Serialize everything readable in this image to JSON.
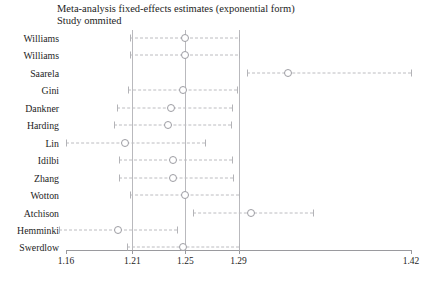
{
  "chart_data": {
    "type": "scatter",
    "title": "Meta-analysis fixed-effects estimates (exponential form)",
    "subtitle": "Study ommited",
    "xlabel": "",
    "ylabel": "",
    "xlim": [
      1.16,
      1.42
    ],
    "grid": false,
    "legend": null,
    "xticks": [
      1.16,
      1.21,
      1.25,
      1.29,
      1.42
    ],
    "xtick_labels": [
      "1.16",
      "1.21",
      "1.25",
      "1.29",
      "1.42"
    ],
    "reference_lines": [
      1.21,
      1.25,
      1.29
    ],
    "categories": [
      "Williams",
      "Williams",
      "Saarela",
      "Gini",
      "Dankner",
      "Harding",
      "Lin",
      "Idilbi",
      "Zhang",
      "Wotton",
      "Atchison",
      "Hemminki",
      "Swerdlow"
    ],
    "values": [
      1.25,
      1.25,
      1.327,
      1.248,
      1.239,
      1.237,
      1.2045,
      1.2405,
      1.2405,
      1.2495,
      1.2995,
      1.1995,
      1.248
    ],
    "lower": [
      1.2085,
      1.2085,
      1.2965,
      1.207,
      1.1985,
      1.196,
      1.1598,
      1.2,
      1.2,
      1.2085,
      1.256,
      1.155,
      1.206
    ],
    "upper": [
      1.29,
      1.29,
      1.42,
      1.289,
      1.285,
      1.2845,
      1.2645,
      1.285,
      1.2855,
      1.2905,
      1.346,
      1.244,
      1.2905
    ],
    "marker_style": "open-circle",
    "ci_style": "dashed-line-with-caps"
  }
}
